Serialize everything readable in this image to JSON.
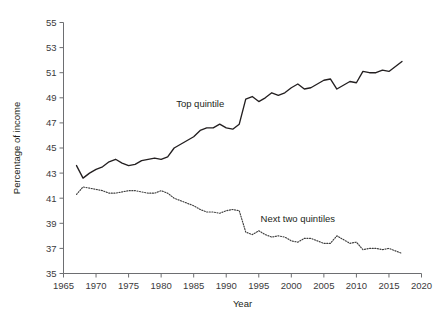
{
  "chart_data": {
    "type": "line",
    "title": "",
    "xlabel": "Year",
    "ylabel": "Percentage of income",
    "xlim": [
      1965,
      2020
    ],
    "ylim": [
      35,
      55
    ],
    "xticks": [
      1965,
      1970,
      1975,
      1980,
      1985,
      1990,
      1995,
      2000,
      2005,
      2010,
      2015,
      2020
    ],
    "yticks": [
      35,
      37,
      39,
      41,
      43,
      45,
      47,
      49,
      51,
      53,
      55
    ],
    "grid": false,
    "legend_position": "inline-annotation",
    "x": [
      1967,
      1968,
      1969,
      1970,
      1971,
      1972,
      1973,
      1974,
      1975,
      1976,
      1977,
      1978,
      1979,
      1980,
      1981,
      1982,
      1983,
      1984,
      1985,
      1986,
      1987,
      1988,
      1989,
      1990,
      1991,
      1992,
      1993,
      1994,
      1995,
      1996,
      1997,
      1998,
      1999,
      2000,
      2001,
      2002,
      2003,
      2004,
      2005,
      2006,
      2007,
      2008,
      2009,
      2010,
      2011,
      2012,
      2013,
      2014,
      2015,
      2016,
      2017
    ],
    "series": [
      {
        "name": "Top quintile",
        "style": "solid",
        "color": "#231f20",
        "values": [
          43.6,
          42.6,
          43.0,
          43.3,
          43.5,
          43.9,
          44.1,
          43.8,
          43.6,
          43.7,
          44.0,
          44.1,
          44.2,
          44.1,
          44.3,
          45.0,
          45.3,
          45.6,
          45.9,
          46.4,
          46.6,
          46.6,
          46.9,
          46.6,
          46.5,
          46.9,
          48.9,
          49.1,
          48.7,
          49.0,
          49.4,
          49.2,
          49.4,
          49.8,
          50.1,
          49.7,
          49.8,
          50.1,
          50.4,
          50.5,
          49.7,
          50.0,
          50.3,
          50.2,
          51.1,
          51.0,
          51.0,
          51.2,
          51.1,
          51.5,
          51.9
        ]
      },
      {
        "name": "Next two quintiles",
        "style": "dotted",
        "color": "#3f3f3f",
        "values": [
          41.3,
          41.9,
          41.8,
          41.7,
          41.6,
          41.4,
          41.4,
          41.5,
          41.6,
          41.6,
          41.5,
          41.4,
          41.4,
          41.6,
          41.4,
          41.0,
          40.8,
          40.6,
          40.4,
          40.1,
          39.9,
          39.9,
          39.8,
          40.0,
          40.1,
          40.0,
          38.3,
          38.1,
          38.4,
          38.1,
          37.9,
          38.0,
          37.9,
          37.6,
          37.5,
          37.8,
          37.8,
          37.6,
          37.4,
          37.4,
          38.0,
          37.7,
          37.4,
          37.5,
          36.9,
          37.0,
          37.0,
          36.9,
          37.0,
          36.8,
          36.6
        ]
      }
    ],
    "annotations": [
      {
        "text": "Top quintile",
        "x": 1986,
        "y": 48.3
      },
      {
        "text": "Next two quintiles",
        "y": 39.1,
        "x": 2001
      }
    ]
  }
}
